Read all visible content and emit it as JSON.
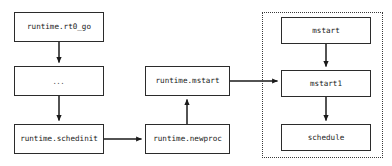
{
  "diagram": {
    "background_color": "#ffffff",
    "node_border_color": "#2b2b2b",
    "group_border_color": "#3a3a3a",
    "arrow_color": "#1a1a1a",
    "nodes": [
      {
        "id": "rt0_go",
        "label": "runtime.rt0_go",
        "x": 14,
        "y": 12,
        "w": 90,
        "h": 30,
        "mono": true
      },
      {
        "id": "ellipsis",
        "label": "...",
        "x": 14,
        "y": 66,
        "w": 90,
        "h": 30,
        "mono": false
      },
      {
        "id": "schedinit",
        "label": "runtime.schedinit",
        "x": 14,
        "y": 124,
        "w": 90,
        "h": 30,
        "mono": true
      },
      {
        "id": "mstart",
        "label": "runtime.mstart",
        "x": 145,
        "y": 66,
        "w": 85,
        "h": 30,
        "mono": true
      },
      {
        "id": "newproc",
        "label": "runtime.newproc",
        "x": 145,
        "y": 124,
        "w": 85,
        "h": 30,
        "mono": true
      },
      {
        "id": "g_mstart",
        "label": "mstart",
        "x": 281,
        "y": 17,
        "w": 90,
        "h": 27,
        "mono": true
      },
      {
        "id": "mstart1",
        "label": "mstart1",
        "x": 281,
        "y": 70,
        "w": 90,
        "h": 27,
        "mono": true
      },
      {
        "id": "schedule",
        "label": "schedule",
        "x": 281,
        "y": 124,
        "w": 90,
        "h": 27,
        "mono": true
      }
    ],
    "group": {
      "id": "scheduler-group",
      "label": "",
      "x": 262,
      "y": 12,
      "w": 121,
      "h": 146,
      "style": "dotted"
    },
    "edges": [
      {
        "id": "e1",
        "from": "rt0_go",
        "to": "ellipsis",
        "direction": "down"
      },
      {
        "id": "e2",
        "from": "ellipsis",
        "to": "schedinit",
        "direction": "down"
      },
      {
        "id": "e3",
        "from": "schedinit",
        "to": "newproc",
        "direction": "right"
      },
      {
        "id": "e4",
        "from": "newproc",
        "to": "mstart",
        "direction": "up"
      },
      {
        "id": "e5",
        "from": "mstart",
        "to": "mstart1",
        "direction": "right"
      },
      {
        "id": "e6",
        "from": "g_mstart",
        "to": "mstart1",
        "direction": "down"
      },
      {
        "id": "e7",
        "from": "mstart1",
        "to": "schedule",
        "direction": "down"
      }
    ]
  }
}
